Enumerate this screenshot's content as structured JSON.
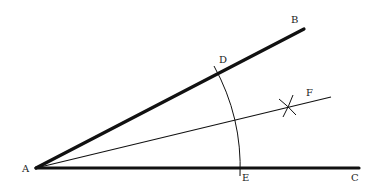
{
  "diagram": {
    "colors": {
      "stroke": "#111111",
      "label": "#222222",
      "background": "#ffffff"
    },
    "points": {
      "A": {
        "label": "A",
        "x": 36,
        "y": 168,
        "label_x": 22,
        "label_y": 172
      },
      "B": {
        "label": "B",
        "x": 304,
        "y": 29,
        "label_x": 291,
        "label_y": 23
      },
      "C": {
        "label": "C",
        "x": 359,
        "y": 168,
        "label_x": 351,
        "label_y": 181
      },
      "D": {
        "label": "D",
        "x": 219,
        "y": 73,
        "label_x": 219,
        "label_y": 63
      },
      "E": {
        "label": "E",
        "x": 240,
        "y": 168,
        "label_x": 242,
        "label_y": 181
      },
      "F": {
        "label": "F",
        "x": 331,
        "y": 97,
        "label_x": 306,
        "label_y": 96
      }
    },
    "segments": [
      {
        "name": "ray-AB",
        "from": "A",
        "to": "B",
        "weight": "heavy"
      },
      {
        "name": "ray-AC",
        "from": "A",
        "to": "C",
        "weight": "heavy"
      },
      {
        "name": "bisector-AF",
        "from": "A",
        "to": "F",
        "weight": "light"
      }
    ],
    "arcs": [
      {
        "name": "arc-DE",
        "center": "A",
        "through": [
          "D",
          "E"
        ]
      }
    ],
    "marks": [
      {
        "name": "intersection-cross",
        "x": 288,
        "y": 107
      }
    ]
  }
}
